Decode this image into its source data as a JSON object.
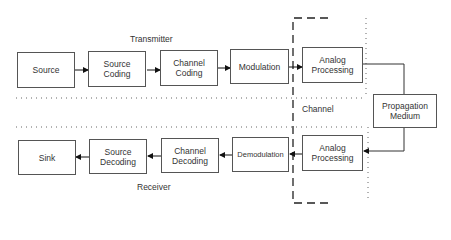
{
  "diagram": {
    "labels": {
      "transmitter": "Transmitter",
      "channel": "Channel",
      "receiver": "Receiver"
    },
    "transmitter_blocks": [
      {
        "label": "Source"
      },
      {
        "label": "Source\nCoding"
      },
      {
        "label": "Channel\nCoding"
      },
      {
        "label": "Modulation"
      },
      {
        "label": "Analog\nProcessing"
      }
    ],
    "channel_block": {
      "label": "Propagation\nMedium"
    },
    "receiver_blocks": [
      {
        "label": "Sink"
      },
      {
        "label": "Source\nDecoding"
      },
      {
        "label": "Channel\nDecoding"
      },
      {
        "label": "Demodulation"
      },
      {
        "label": "Analog\nProcessing"
      }
    ]
  }
}
